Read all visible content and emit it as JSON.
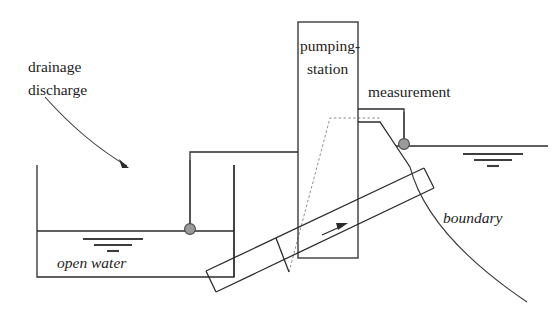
{
  "figure": {
    "kind": "hydraulic-schematic",
    "width": 552,
    "height": 333,
    "background": "#ffffff",
    "line_color": "#2b2b2b",
    "dashed_color": "#8e8e8e",
    "sensor_color": "#9a9a9a"
  },
  "labels": {
    "drainage_line1": "drainage",
    "drainage_line2": "discharge",
    "pumping_line1": "pumping-",
    "pumping_line2": "station",
    "measurement": "measurement",
    "open_water": "open water",
    "boundary": "boundary"
  },
  "elements": {
    "left_basin": "open-water-basin",
    "inlet_channel": "inlet-channel",
    "pumping_station_box": "pumping-station-box",
    "measurement_box": "measurement-structure",
    "dike_dashed": "dike-outline-dashed",
    "embankment": "embankment-slope",
    "pipe": "pressure-pipe",
    "flow_arrow": "flow-direction-arrow",
    "sensor_left": "water-level-sensor-left",
    "sensor_right": "water-level-sensor-right",
    "water_level_left": "water-level-symbol-left",
    "water_level_right": "water-level-symbol-right",
    "discharge_curve": "drainage-discharge-curve",
    "boundary_curve": "boundary-curve"
  }
}
